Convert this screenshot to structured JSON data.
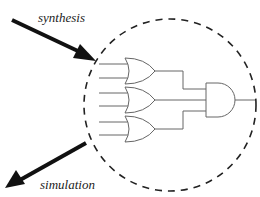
{
  "labels": {
    "synthesis": "synthesis",
    "simulation": "simulation"
  },
  "diagram": {
    "boundary": {
      "shape": "dashed-circle",
      "cx": 170,
      "cy": 105,
      "r": 86
    },
    "gates": [
      {
        "type": "OR",
        "inputs": 2,
        "position": "top"
      },
      {
        "type": "OR",
        "inputs": 2,
        "position": "middle"
      },
      {
        "type": "OR",
        "inputs": 2,
        "position": "bottom"
      },
      {
        "type": "AND",
        "inputs": 3,
        "position": "right"
      }
    ],
    "arrows": [
      {
        "label": "synthesis",
        "direction": "into-circle"
      },
      {
        "label": "simulation",
        "direction": "out-of-circle"
      }
    ],
    "colors": {
      "stroke": "#111111",
      "gate": "#555555",
      "background": "#ffffff"
    }
  }
}
